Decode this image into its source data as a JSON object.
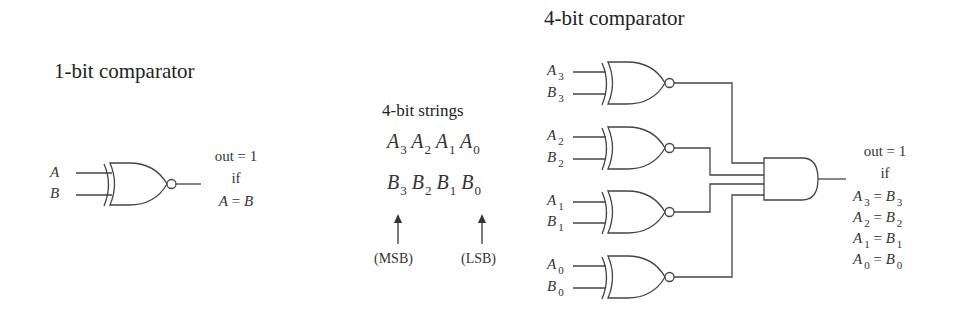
{
  "one_bit": {
    "title": "1-bit comparator",
    "inputs": [
      "A",
      "B"
    ],
    "out_line1": "out = 1",
    "out_line2": "if",
    "cond_left": "A",
    "cond_eq": " = ",
    "cond_right": "B"
  },
  "strings": {
    "title": "4-bit strings",
    "a_var": "A",
    "b_var": "B",
    "indices": [
      "3",
      "2",
      "1",
      "0"
    ],
    "msb_label": "(MSB)",
    "lsb_label": "(LSB)"
  },
  "four_bit": {
    "title": "4-bit comparator",
    "gates": [
      {
        "a": "A",
        "b": "B",
        "idx": "3"
      },
      {
        "a": "A",
        "b": "B",
        "idx": "2"
      },
      {
        "a": "A",
        "b": "B",
        "idx": "1"
      },
      {
        "a": "A",
        "b": "B",
        "idx": "0"
      }
    ],
    "out_line1": "out = 1",
    "out_line2": "if",
    "conditions": [
      {
        "left": "A",
        "idx": "3",
        "eq": " = ",
        "right": "B"
      },
      {
        "left": "A",
        "idx": "2",
        "eq": " = ",
        "right": "B"
      },
      {
        "left": "A",
        "idx": "1",
        "eq": " = ",
        "right": "B"
      },
      {
        "left": "A",
        "idx": "0",
        "eq": " = ",
        "right": "B"
      }
    ]
  }
}
